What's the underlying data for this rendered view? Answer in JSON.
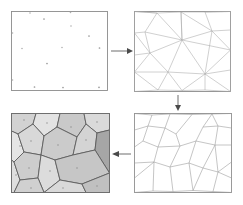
{
  "figure": {
    "panel_count": 4,
    "flow": "clockwise"
  },
  "panels": [
    {
      "id": "panel-seed-points",
      "label": "Seed points",
      "step": 1,
      "position": "top-left",
      "frame": {
        "x": 11,
        "y": 11,
        "width": 97,
        "height": 80
      },
      "fill": "#ffffff",
      "stroke": "#8c8c8c",
      "points": [
        [
          34.5,
          87.0
        ],
        [
          63.0,
          87.5
        ],
        [
          99.0,
          87.3
        ],
        [
          12.5,
          80.0
        ],
        [
          47.0,
          63.5
        ],
        [
          22.0,
          48.5
        ],
        [
          99.5,
          48.0
        ],
        [
          62.0,
          47.5
        ],
        [
          89.0,
          36.0
        ],
        [
          71.0,
          26.0
        ],
        [
          44.0,
          19.0
        ],
        [
          30.0,
          11.5
        ],
        [
          70.5,
          11.5
        ],
        [
          99.0,
          11.5
        ],
        [
          12.0,
          33.0
        ],
        [
          12.2,
          62.5
        ],
        [
          108.0,
          63.0
        ]
      ]
    },
    {
      "id": "panel-delaunay",
      "label": "Delaunay triangulation",
      "step": 2,
      "position": "top-right",
      "frame": {
        "x": 134,
        "y": 11,
        "width": 97,
        "height": 81
      },
      "fill": "#ffffff",
      "stroke": "#8c8c8c",
      "edge_color": "#a8a8a8"
    },
    {
      "id": "panel-voronoi-edges",
      "label": "Voronoi edges",
      "step": 3,
      "position": "bottom-right",
      "frame": {
        "x": 134,
        "y": 113,
        "width": 99,
        "height": 80
      },
      "fill": "#ffffff",
      "stroke": "#8c8c8c",
      "edge_color": "#9e9e9e"
    },
    {
      "id": "panel-voronoi-filled",
      "label": "Filled Voronoi cells",
      "step": 4,
      "position": "bottom-left",
      "frame": {
        "x": 11,
        "y": 113,
        "width": 99,
        "height": 80
      },
      "stroke": "#5a5a5a",
      "cell_fills": [
        "#d2d2d2",
        "#e3e3e3",
        "#cfcfcf",
        "#dcdcdc",
        "#c8c8c8",
        "#d8d8d8",
        "#bdbdbd",
        "#a8a8a8",
        "#e0e0e0",
        "#cccccc",
        "#d5d5d5",
        "#c3c3c3",
        "#dadada",
        "#cacaca",
        "#d0d0d0"
      ],
      "dark_cell_fill": "#a8a8a8",
      "light_cell_fill": "#e3e3e3"
    }
  ],
  "arrows": [
    {
      "id": "arrow-1",
      "from": "panel-seed-points",
      "to": "panel-delaunay",
      "direction": "right",
      "x1": 112,
      "y1": 51,
      "x2": 131,
      "y2": 51
    },
    {
      "id": "arrow-2",
      "from": "panel-delaunay",
      "to": "panel-voronoi-edges",
      "direction": "down",
      "x1": 178,
      "y1": 95,
      "x2": 178,
      "y2": 110
    },
    {
      "id": "arrow-3",
      "from": "panel-voronoi-edges",
      "to": "panel-voronoi-filled",
      "direction": "left",
      "x1": 131,
      "y1": 154,
      "x2": 113,
      "y2": 154
    }
  ],
  "colors": {
    "background": "#ffffff",
    "frame_stroke": "#8c8c8c",
    "arrow": "#7a7a7a",
    "arrow_head": "#4a4a4a",
    "triangulation_edge": "#a8a8a8",
    "voronoi_edge": "#9e9e9e",
    "cell_border": "#5a5a5a"
  }
}
